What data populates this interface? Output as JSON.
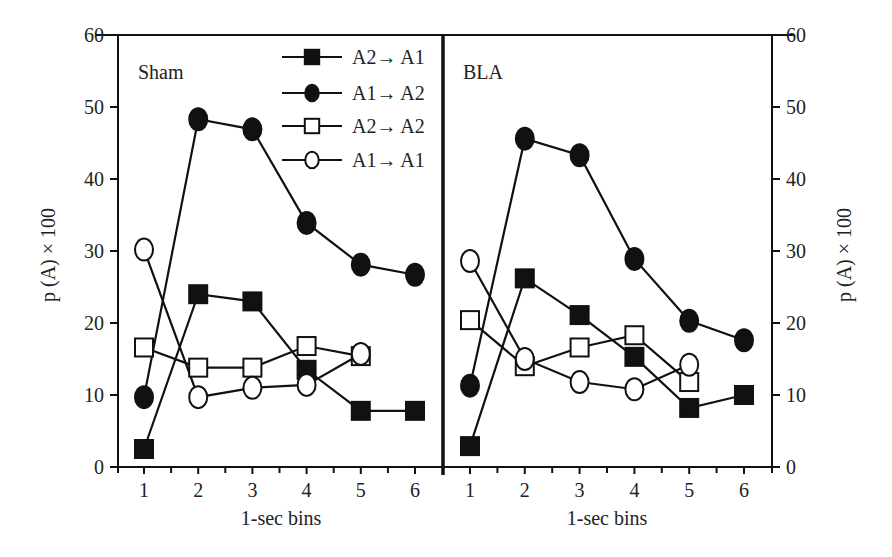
{
  "chart_data": {
    "type": "line",
    "x": [
      1,
      2,
      3,
      4,
      5,
      6
    ],
    "xlabel": "1-sec bins",
    "ylabel": "p (A) × 100",
    "ylim": [
      0,
      60
    ],
    "yticks": [
      0,
      10,
      20,
      30,
      40,
      50,
      60
    ],
    "xticks": [
      "1",
      "2",
      "3",
      "4",
      "5",
      "6"
    ],
    "grid": false,
    "legend_position": "upper-right of left panel",
    "legend": [
      {
        "label": "A2→ A1",
        "marker": "filled-square"
      },
      {
        "label": "A1→ A2",
        "marker": "filled-circle"
      },
      {
        "label": "A2→ A2",
        "marker": "open-square"
      },
      {
        "label": "A1→ A1",
        "marker": "open-circle"
      }
    ],
    "panels": [
      {
        "title": "Sham",
        "yaxis_side": "left",
        "series": [
          {
            "name": "A2→ A1",
            "marker": "filled-square",
            "values": [
              2.5,
              24.0,
              23.0,
              13.5,
              7.8,
              7.8
            ]
          },
          {
            "name": "A1→ A2",
            "marker": "filled-circle",
            "values": [
              9.7,
              48.3,
              46.9,
              33.9,
              28.1,
              26.7
            ]
          },
          {
            "name": "A2→ A2",
            "marker": "open-square",
            "values": [
              16.6,
              13.8,
              13.8,
              16.8,
              15.4,
              null
            ]
          },
          {
            "name": "A1→ A1",
            "marker": "open-circle",
            "values": [
              30.2,
              9.7,
              11.0,
              11.4,
              15.7,
              null
            ]
          }
        ]
      },
      {
        "title": "BLA",
        "yaxis_side": "right",
        "series": [
          {
            "name": "A2→ A1",
            "marker": "filled-square",
            "values": [
              2.9,
              26.2,
              21.1,
              15.3,
              8.2,
              10.0
            ]
          },
          {
            "name": "A1→ A2",
            "marker": "filled-circle",
            "values": [
              11.3,
              45.6,
              43.3,
              28.9,
              20.3,
              17.6
            ]
          },
          {
            "name": "A2→ A2",
            "marker": "open-square",
            "values": [
              20.4,
              14.0,
              16.6,
              18.3,
              11.8,
              null
            ]
          },
          {
            "name": "A1→ A1",
            "marker": "open-circle",
            "values": [
              28.6,
              15.0,
              11.8,
              10.8,
              14.2,
              null
            ]
          }
        ]
      }
    ]
  },
  "layout": {
    "y_zero_px": 467,
    "px_per_unit": 7.2,
    "panels_px": [
      {
        "frame_left": 118,
        "frame_right": 443,
        "tick1": 144,
        "tick6": 415
      },
      {
        "frame_left": 443,
        "frame_right": 772,
        "tick1": 470,
        "tick6": 744
      }
    ],
    "colors": {
      "ink": "#111111",
      "background": "#ffffff"
    }
  }
}
